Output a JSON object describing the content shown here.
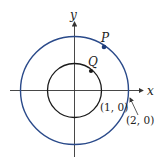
{
  "diagram": {
    "axes": {
      "x_label": "x",
      "y_label": "y"
    },
    "circles": [
      {
        "name": "inner",
        "radius_units": 1,
        "color": "#1a1a1a"
      },
      {
        "name": "outer",
        "radius_units": 2,
        "color": "#2a4a8a"
      }
    ],
    "points": [
      {
        "label": "P",
        "on": "outer",
        "color": "#1f3d7a"
      },
      {
        "label": "Q",
        "on": "inner",
        "color": "#1a1a1a"
      }
    ],
    "annotations": [
      {
        "text": "(1, 0)"
      },
      {
        "text": "(2, 0)"
      }
    ]
  }
}
